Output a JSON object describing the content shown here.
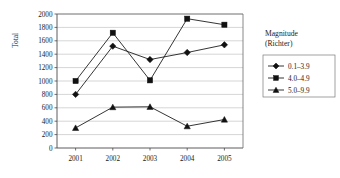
{
  "chart_data": {
    "type": "line",
    "title": "",
    "xlabel": "",
    "ylabel": "Total",
    "categories": [
      "2001",
      "2002",
      "2003",
      "2004",
      "2005"
    ],
    "ylim": [
      0,
      2000
    ],
    "yticks": [
      "0",
      "200",
      "400",
      "600",
      "800",
      "1000",
      "1200",
      "1400",
      "1600",
      "1800",
      "2000"
    ],
    "grid": true,
    "legend_position": "right",
    "legend_title_line1": "Magnitude",
    "legend_title_line2": "(Richter)",
    "series": [
      {
        "name": "0.1–3.9",
        "marker": "diamond",
        "values": [
          800,
          1520,
          1320,
          1425,
          1540
        ]
      },
      {
        "name": "4.0–4.9",
        "marker": "square",
        "values": [
          1000,
          1720,
          1010,
          1930,
          1840
        ]
      },
      {
        "name": "5.0–9.9",
        "marker": "triangle",
        "values": [
          300,
          610,
          615,
          325,
          425
        ]
      }
    ],
    "colors": {
      "series_line": "#111111",
      "marker": "#111111",
      "gridline": "#b9b9b9",
      "axis": "#4a4a4a",
      "background": "#ffffff"
    }
  }
}
